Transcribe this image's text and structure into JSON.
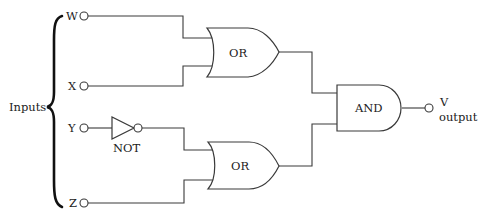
{
  "diagram": {
    "type": "logic-circuit",
    "group_label": "Inputs",
    "inputs": [
      {
        "id": "W",
        "label": "W"
      },
      {
        "id": "X",
        "label": "X"
      },
      {
        "id": "Y",
        "label": "Y"
      },
      {
        "id": "Z",
        "label": "Z"
      }
    ],
    "gates": [
      {
        "id": "not1",
        "type": "NOT",
        "label": "NOT",
        "inputs": [
          "Y"
        ]
      },
      {
        "id": "or1",
        "type": "OR",
        "label": "OR",
        "inputs": [
          "W",
          "X"
        ]
      },
      {
        "id": "or2",
        "type": "OR",
        "label": "OR",
        "inputs": [
          "not1",
          "Z"
        ]
      },
      {
        "id": "and1",
        "type": "AND",
        "label": "AND",
        "inputs": [
          "or1",
          "or2"
        ]
      }
    ],
    "output": {
      "id": "V",
      "label": "V",
      "sublabel": "output",
      "source": "and1"
    },
    "expression": "V = (W + X) · (¬Y + Z)"
  }
}
